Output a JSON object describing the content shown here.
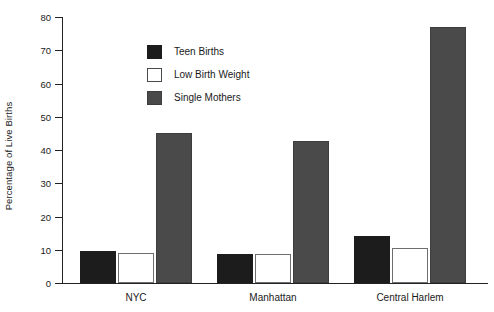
{
  "chart_data": {
    "type": "bar",
    "title": "",
    "xlabel": "",
    "ylabel": "Percentage of Live Births",
    "ylim": [
      0,
      80
    ],
    "yticks": [
      0,
      10,
      20,
      30,
      40,
      50,
      60,
      70,
      80
    ],
    "ytick_labels": [
      "0",
      "10",
      "20",
      "30",
      "40",
      "50",
      "60",
      "70",
      "80"
    ],
    "grid": false,
    "legend_position": "upper-center-inside",
    "categories": [
      "NYC",
      "Manhattan",
      "Central Harlem"
    ],
    "series": [
      {
        "name": "Teen Births",
        "color": "#1c1c1c",
        "values": [
          9.5,
          8.7,
          14.0
        ]
      },
      {
        "name": "Low Birth Weight",
        "color": "#ffffff",
        "values": [
          9.0,
          8.7,
          10.5
        ]
      },
      {
        "name": "Single Mothers",
        "color": "#4a4a4a",
        "values": [
          45.0,
          42.7,
          77.0
        ]
      }
    ]
  },
  "legend": {
    "items": [
      {
        "label": "Teen Births",
        "swatch": "filled-black-square-icon"
      },
      {
        "label": "Low Birth Weight",
        "swatch": "outlined-white-square-icon"
      },
      {
        "label": "Single Mothers",
        "swatch": "filled-gray-square-icon"
      }
    ]
  },
  "axes": {
    "y_title": "Percentage of Live Births",
    "y_labels": [
      "80",
      "70",
      "60",
      "50",
      "40",
      "30",
      "20",
      "10",
      "0"
    ],
    "x_labels": [
      "NYC",
      "Manhattan",
      "Central Harlem"
    ]
  }
}
